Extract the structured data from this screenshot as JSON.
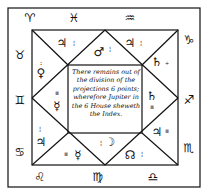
{
  "zodiac_signs": {
    "top": [
      "♈",
      "♓",
      "♒"
    ],
    "right": [
      "♑",
      "♐",
      "♏"
    ],
    "bottom": [
      "♌",
      "♍",
      "♎"
    ],
    "left": [
      "♉",
      "♊",
      "♋"
    ]
  },
  "houses": [
    {
      "planet": "♃",
      "marks": "¦"
    },
    {
      "planet": "♂",
      "marks": "¦"
    },
    {
      "planet": "♃",
      "marks": "¦"
    },
    {
      "planet": "♄",
      "marks": "÷"
    },
    {
      "planet": "♄",
      "marks": "≡"
    },
    {
      "planet": "♃",
      "marks": "≡"
    },
    {
      "planet": "☊",
      "marks": "¦"
    },
    {
      "planet": "☽",
      "marks": "¦"
    },
    {
      "planet": "☿",
      "marks": "≡"
    },
    {
      "planet": "♃",
      "marks": "¦"
    },
    {
      "planet": "☿",
      "marks": "≡"
    },
    {
      "planet": "♀",
      "marks": ":"
    }
  ],
  "center_text": "There remains out of the division of the projections 6 points; wherefore Jupiter in the 6 House sheweth the Index."
}
